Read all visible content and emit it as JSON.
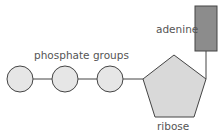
{
  "diagram": {
    "labels": {
      "phosphate": "phosphate groups",
      "adenine": "adenine",
      "ribose": "ribose"
    },
    "components": {
      "phosphate_groups": {
        "count": 3,
        "shape": "circle",
        "fill": "#e6e6e6"
      },
      "ribose": {
        "shape": "pentagon",
        "fill": "#d9d9d9"
      },
      "adenine": {
        "shape": "rectangle",
        "fill": "#8c8c8c"
      }
    },
    "colors": {
      "stroke": "#444444",
      "text": "#555555"
    }
  }
}
